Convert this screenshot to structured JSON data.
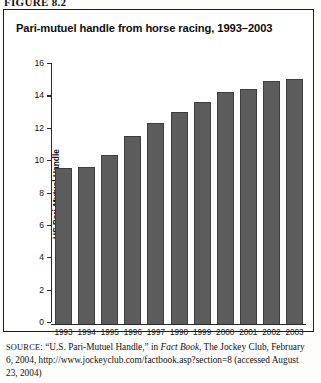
{
  "figure_label": "FIGURE 8.2",
  "chart_title": "Pari-mutuel handle from horse racing, 1993–2003",
  "source": {
    "prefix": "SOURCE",
    "part1": ": “U.S. Pari-Mutuel Handle,” in ",
    "italic": "Fact Book",
    "part2": ", The Jockey Club, February 6, 2004, http://www.jockeyclub.com/factbook.asp?section=8 (accessed August 23, 2004)"
  },
  "chart_data": {
    "type": "bar",
    "title": "Pari-mutuel handle from horse racing, 1993–2003",
    "xlabel": "",
    "ylabel": "US Pari-Mutuel Handle",
    "categories": [
      "1993",
      "1994",
      "1995",
      "1996",
      "1997",
      "1998",
      "1999",
      "2000",
      "2001",
      "2002",
      "2003"
    ],
    "values": [
      9.6,
      9.7,
      10.4,
      11.6,
      12.4,
      13.1,
      13.7,
      14.3,
      14.5,
      15.0,
      15.1
    ],
    "ylim": [
      0,
      16
    ],
    "yticks": [
      0,
      2,
      4,
      6,
      8,
      10,
      12,
      14,
      16
    ],
    "ytick_labels": [
      "0",
      "2",
      "4",
      "6",
      "8",
      "10",
      "12",
      "14",
      "16"
    ],
    "grid": false,
    "legend": "none",
    "bar_color": "#5c5c5c"
  }
}
